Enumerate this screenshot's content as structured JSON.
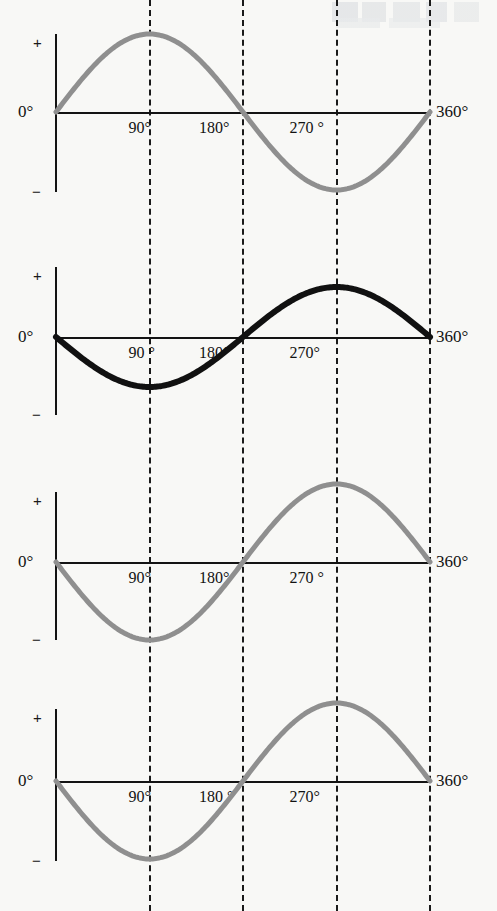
{
  "figure": {
    "background_color": "#f8f8f6",
    "axis_color": "#131313",
    "gridline_color": "#1a1a1a",
    "panel_count": 4
  },
  "axis_labels": {
    "plus": "+",
    "minus": "−",
    "zero": "0°",
    "end": "360°"
  },
  "gridlines_x_deg": [
    90,
    180,
    270,
    360
  ],
  "chart_data": [
    {
      "type": "line",
      "title": "",
      "xlabel": "",
      "ylabel": "",
      "series": [
        {
          "name": "sine",
          "formula": "sin(x)",
          "color": "#8f8f8f",
          "line_width": 5,
          "amplitude": 1.0,
          "phase_deg": 0,
          "points": [
            {
              "x": 0,
              "y": 0.0
            },
            {
              "x": 30,
              "y": 0.5
            },
            {
              "x": 60,
              "y": 0.87
            },
            {
              "x": 90,
              "y": 1.0
            },
            {
              "x": 120,
              "y": 0.87
            },
            {
              "x": 150,
              "y": 0.5
            },
            {
              "x": 180,
              "y": 0.0
            },
            {
              "x": 210,
              "y": -0.5
            },
            {
              "x": 240,
              "y": -0.87
            },
            {
              "x": 270,
              "y": -1.0
            },
            {
              "x": 300,
              "y": -0.87
            },
            {
              "x": 330,
              "y": -0.5
            },
            {
              "x": 360,
              "y": 0.0
            }
          ]
        }
      ],
      "x": [
        0,
        90,
        180,
        270,
        360
      ],
      "xlim": [
        0,
        360
      ],
      "ylim": [
        -1.15,
        1.15
      ],
      "grid": true,
      "tick_labels": [
        {
          "deg": 90,
          "text": "90°"
        },
        {
          "deg": 180,
          "text": "180°"
        },
        {
          "deg": 270,
          "text": "270 °"
        }
      ],
      "legend": "none"
    },
    {
      "type": "line",
      "title": "",
      "xlabel": "",
      "ylabel": "",
      "series": [
        {
          "name": "inverted-cosine",
          "formula": "-cos(x)",
          "color": "#111111",
          "line_width": 6,
          "amplitude": 0.64,
          "phase_deg": 180,
          "points": [
            {
              "x": 0,
              "y": -0.64
            },
            {
              "x": 30,
              "y": -0.55
            },
            {
              "x": 60,
              "y": -0.32
            },
            {
              "x": 90,
              "y": 0.0
            },
            {
              "x": 120,
              "y": 0.32
            },
            {
              "x": 150,
              "y": 0.55
            },
            {
              "x": 180,
              "y": 0.64
            },
            {
              "x": 210,
              "y": 0.55
            },
            {
              "x": 240,
              "y": 0.32
            },
            {
              "x": 270,
              "y": 0.0
            },
            {
              "x": 300,
              "y": -0.32
            },
            {
              "x": 330,
              "y": -0.55
            },
            {
              "x": 360,
              "y": -0.64
            }
          ]
        }
      ],
      "x": [
        0,
        90,
        180,
        270,
        360
      ],
      "xlim": [
        0,
        360
      ],
      "ylim": [
        -1.15,
        1.15
      ],
      "grid": true,
      "tick_labels": [
        {
          "deg": 90,
          "text": "90 °"
        },
        {
          "deg": 180,
          "text": "180°"
        },
        {
          "deg": 270,
          "text": "270°"
        }
      ],
      "legend": "none"
    },
    {
      "type": "line",
      "title": "",
      "xlabel": "",
      "ylabel": "",
      "series": [
        {
          "name": "negative-sine",
          "formula": "-sin(x)",
          "color": "#8f8f8f",
          "line_width": 5,
          "amplitude": 1.0,
          "phase_deg": 180,
          "points": [
            {
              "x": 0,
              "y": 0.0
            },
            {
              "x": 30,
              "y": -0.5
            },
            {
              "x": 60,
              "y": -0.87
            },
            {
              "x": 90,
              "y": -1.0
            },
            {
              "x": 120,
              "y": -0.87
            },
            {
              "x": 150,
              "y": -0.5
            },
            {
              "x": 180,
              "y": 0.0
            },
            {
              "x": 210,
              "y": 0.5
            },
            {
              "x": 240,
              "y": 0.87
            },
            {
              "x": 270,
              "y": 1.0
            },
            {
              "x": 300,
              "y": 0.87
            },
            {
              "x": 330,
              "y": 0.5
            },
            {
              "x": 360,
              "y": 0.0
            }
          ]
        }
      ],
      "x": [
        0,
        90,
        180,
        270,
        360
      ],
      "xlim": [
        0,
        360
      ],
      "ylim": [
        -1.15,
        1.15
      ],
      "grid": true,
      "tick_labels": [
        {
          "deg": 90,
          "text": "90°"
        },
        {
          "deg": 180,
          "text": "180°"
        },
        {
          "deg": 270,
          "text": "270 °"
        }
      ],
      "legend": "none"
    },
    {
      "type": "line",
      "title": "",
      "xlabel": "",
      "ylabel": "",
      "series": [
        {
          "name": "negative-sine",
          "formula": "-sin(x)",
          "color": "#8f8f8f",
          "line_width": 5,
          "amplitude": 1.0,
          "phase_deg": 180,
          "points": [
            {
              "x": 0,
              "y": 0.0
            },
            {
              "x": 30,
              "y": -0.5
            },
            {
              "x": 60,
              "y": -0.87
            },
            {
              "x": 90,
              "y": -1.0
            },
            {
              "x": 120,
              "y": -0.87
            },
            {
              "x": 150,
              "y": -0.5
            },
            {
              "x": 180,
              "y": 0.0
            },
            {
              "x": 210,
              "y": 0.5
            },
            {
              "x": 240,
              "y": 0.87
            },
            {
              "x": 270,
              "y": 1.0
            },
            {
              "x": 300,
              "y": 0.87
            },
            {
              "x": 330,
              "y": 0.5
            },
            {
              "x": 360,
              "y": 0.0
            }
          ]
        }
      ],
      "x": [
        0,
        90,
        180,
        270,
        360
      ],
      "xlim": [
        0,
        360
      ],
      "ylim": [
        -1.15,
        1.15
      ],
      "grid": true,
      "tick_labels": [
        {
          "deg": 90,
          "text": "90°"
        },
        {
          "deg": 180,
          "text": "180 °"
        },
        {
          "deg": 270,
          "text": "270°"
        }
      ],
      "legend": "none"
    }
  ]
}
